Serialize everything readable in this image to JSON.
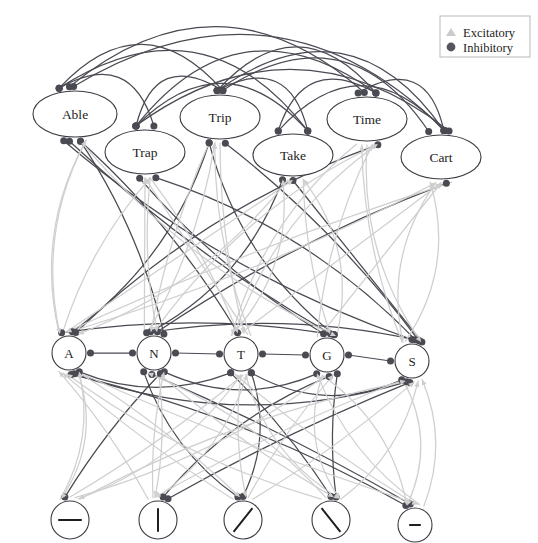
{
  "diagram": {
    "background_color": "#ffffff",
    "inhibitory_color": "#4a4a53",
    "excitatory_color": "#cfcfcf",
    "node_stroke_color": "#3b3b43",
    "node_fill_color": "#ffffff"
  },
  "legend": {
    "excitatory_label": "Excitatory",
    "inhibitory_label": "Inhibitory",
    "excitatory_marker": "triangle-icon",
    "inhibitory_marker": "circle-icon"
  },
  "layers": {
    "word_layer": {
      "name": "word-layer",
      "nodes": [
        {
          "id": "able",
          "label": "Able",
          "cx": 75,
          "cy": 114,
          "rx": 42,
          "ry": 23
        },
        {
          "id": "trap",
          "label": "Trap",
          "cx": 145,
          "cy": 152,
          "rx": 40,
          "ry": 22
        },
        {
          "id": "trip",
          "label": "Trip",
          "cx": 220,
          "cy": 117,
          "rx": 40,
          "ry": 22
        },
        {
          "id": "take",
          "label": "Take",
          "cx": 293,
          "cy": 155,
          "rx": 40,
          "ry": 21
        },
        {
          "id": "time",
          "label": "Time",
          "cx": 367,
          "cy": 119,
          "rx": 40,
          "ry": 22
        },
        {
          "id": "cart",
          "label": "Cart",
          "cx": 441,
          "cy": 157,
          "rx": 40,
          "ry": 22
        }
      ]
    },
    "letter_layer": {
      "name": "letter-layer",
      "nodes": [
        {
          "id": "A",
          "label": "A",
          "cx": 69,
          "cy": 353,
          "r": 17
        },
        {
          "id": "N",
          "label": "N",
          "cx": 154,
          "cy": 353,
          "r": 17
        },
        {
          "id": "T",
          "label": "T",
          "cx": 241,
          "cy": 354,
          "r": 17
        },
        {
          "id": "G",
          "label": "G",
          "cx": 327,
          "cy": 355,
          "r": 17
        },
        {
          "id": "S",
          "label": "S",
          "cx": 412,
          "cy": 361,
          "r": 17
        }
      ]
    },
    "feature_layer": {
      "name": "feature-layer",
      "nodes": [
        {
          "id": "f-horizontal",
          "glyph": "horizontal-line",
          "cx": 70,
          "cy": 520,
          "r": 19
        },
        {
          "id": "f-vertical",
          "glyph": "vertical-line",
          "cx": 158,
          "cy": 520,
          "r": 19
        },
        {
          "id": "f-slash",
          "glyph": "forward-slash",
          "cx": 243,
          "cy": 520,
          "r": 19
        },
        {
          "id": "f-backslash",
          "glyph": "back-slash",
          "cx": 331,
          "cy": 520,
          "r": 19
        },
        {
          "id": "f-dash",
          "glyph": "short-dash",
          "cx": 415,
          "cy": 525,
          "r": 17
        }
      ]
    }
  }
}
